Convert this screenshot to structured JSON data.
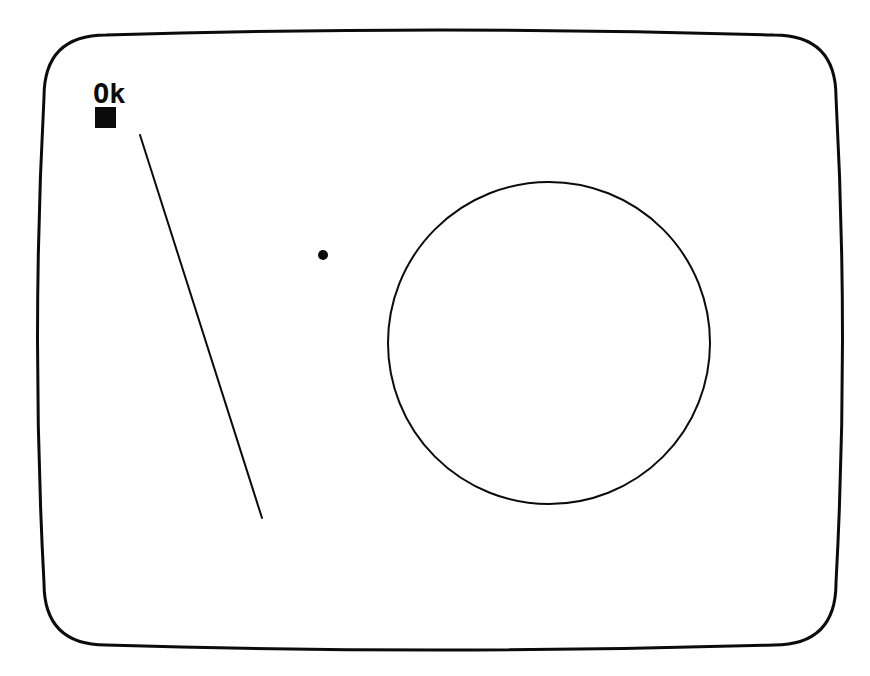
{
  "screen": {
    "label": "crt-monitor-screen",
    "background_color": "#ffffff",
    "ink_color": "#0b0b0b",
    "bezel_stroke_width": 3,
    "width": 870,
    "height": 676
  },
  "terminal": {
    "prompt_text": "Ok",
    "cursor": {
      "shape": "filled-square",
      "x": 95,
      "y": 107,
      "size": 21,
      "color": "#0b0b0b"
    }
  },
  "graphics": {
    "line": {
      "name": "diagonal-line",
      "x1": 140,
      "y1": 135,
      "x2": 262,
      "y2": 518,
      "stroke": "#0b0b0b",
      "stroke_width": 2
    },
    "dot": {
      "name": "filled-dot",
      "cx": 323,
      "cy": 255,
      "r": 5,
      "fill": "#0b0b0b"
    },
    "circle": {
      "name": "outline-circle",
      "cx": 549,
      "cy": 343,
      "r": 161,
      "stroke": "#0b0b0b",
      "stroke_width": 2,
      "fill": "none"
    }
  },
  "bezel": {
    "name": "crt-bezel-outline",
    "top_mid_y": 25,
    "bottom_mid_y": 655,
    "left_mid_x": 31,
    "right_mid_x": 849,
    "corner_top_y": 35,
    "corner_bottom_y": 645,
    "corner_left_x": 44,
    "corner_right_x": 836,
    "corner_radius": 62
  }
}
